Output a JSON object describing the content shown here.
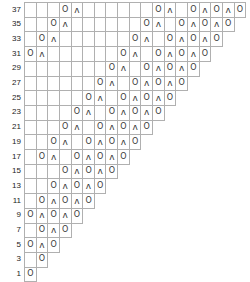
{
  "chart_meta": {
    "title": "",
    "symbol_yarn_over": "O",
    "symbol_decrease": "ʌ",
    "grid_line_color": "#b0b0b0",
    "text_color": "#1b1b1b",
    "background_color": "#ffffff",
    "columns": 19,
    "row_count": 19
  },
  "chart_data": {
    "type": "table",
    "title": "",
    "xlabel": "",
    "ylabel": "",
    "grid": true,
    "legend": [],
    "row_labels": [
      "37",
      "35",
      "33",
      "31",
      "29",
      "27",
      "25",
      "23",
      "21",
      "19",
      "17",
      "15",
      "13",
      "11",
      "9",
      "7",
      "5",
      "3",
      "1"
    ],
    "col_count": 19,
    "symbols": {
      "O": "yarn-over",
      "ʌ": "decrease",
      "": "empty"
    },
    "rows": [
      {
        "label": "37",
        "width": 19,
        "cells": [
          "",
          "",
          "",
          "O",
          "ʌ",
          "",
          "",
          "",
          "",
          "",
          "",
          "O",
          "ʌ",
          "",
          "O",
          "ʌ",
          "O",
          "ʌ",
          "O"
        ]
      },
      {
        "label": "35",
        "width": 18,
        "cells": [
          "",
          "",
          "O",
          "ʌ",
          "",
          "",
          "",
          "",
          "",
          "",
          "O",
          "ʌ",
          "",
          "O",
          "ʌ",
          "O",
          "ʌ",
          "O"
        ]
      },
      {
        "label": "33",
        "width": 17,
        "cells": [
          "",
          "O",
          "ʌ",
          "",
          "",
          "",
          "",
          "",
          "",
          "O",
          "ʌ",
          "",
          "O",
          "ʌ",
          "O",
          "ʌ",
          "O"
        ]
      },
      {
        "label": "31",
        "width": 16,
        "cells": [
          "O",
          "ʌ",
          "",
          "",
          "",
          "",
          "",
          "",
          "O",
          "ʌ",
          "",
          "O",
          "ʌ",
          "O",
          "ʌ",
          "O"
        ]
      },
      {
        "label": "29",
        "width": 15,
        "cells": [
          "",
          "",
          "",
          "",
          "",
          "",
          "",
          "O",
          "ʌ",
          "",
          "O",
          "ʌ",
          "O",
          "ʌ",
          "O"
        ]
      },
      {
        "label": "27",
        "width": 14,
        "cells": [
          "",
          "",
          "",
          "",
          "",
          "",
          "O",
          "ʌ",
          "",
          "O",
          "ʌ",
          "O",
          "ʌ",
          "O"
        ]
      },
      {
        "label": "25",
        "width": 13,
        "cells": [
          "",
          "",
          "",
          "",
          "",
          "O",
          "ʌ",
          "",
          "O",
          "ʌ",
          "O",
          "ʌ",
          "O"
        ]
      },
      {
        "label": "23",
        "width": 12,
        "cells": [
          "",
          "",
          "",
          "",
          "O",
          "ʌ",
          "",
          "O",
          "ʌ",
          "O",
          "ʌ",
          "O"
        ]
      },
      {
        "label": "21",
        "width": 11,
        "cells": [
          "",
          "",
          "",
          "O",
          "ʌ",
          "",
          "O",
          "ʌ",
          "O",
          "ʌ",
          "O"
        ]
      },
      {
        "label": "19",
        "width": 10,
        "cells": [
          "",
          "",
          "O",
          "ʌ",
          "",
          "O",
          "ʌ",
          "O",
          "ʌ",
          "O"
        ]
      },
      {
        "label": "17",
        "width": 9,
        "cells": [
          "",
          "O",
          "ʌ",
          "",
          "O",
          "ʌ",
          "O",
          "ʌ",
          "O"
        ]
      },
      {
        "label": "15",
        "width": 8,
        "cells": [
          "",
          "",
          "",
          "O",
          "ʌ",
          "O",
          "ʌ",
          "O"
        ]
      },
      {
        "label": "13",
        "width": 7,
        "cells": [
          "",
          "",
          "O",
          "ʌ",
          "O",
          "ʌ",
          "O"
        ]
      },
      {
        "label": "11",
        "width": 6,
        "cells": [
          "",
          "O",
          "ʌ",
          "O",
          "ʌ",
          "O"
        ]
      },
      {
        "label": "9",
        "width": 5,
        "cells": [
          "O",
          "ʌ",
          "O",
          "ʌ",
          "O"
        ]
      },
      {
        "label": "7",
        "width": 4,
        "cells": [
          "",
          "O",
          "ʌ",
          "O"
        ]
      },
      {
        "label": "5",
        "width": 3,
        "cells": [
          "O",
          "ʌ",
          "O"
        ]
      },
      {
        "label": "3",
        "width": 2,
        "cells": [
          "",
          "O"
        ]
      },
      {
        "label": "1",
        "width": 1,
        "cells": [
          "O"
        ]
      }
    ]
  }
}
